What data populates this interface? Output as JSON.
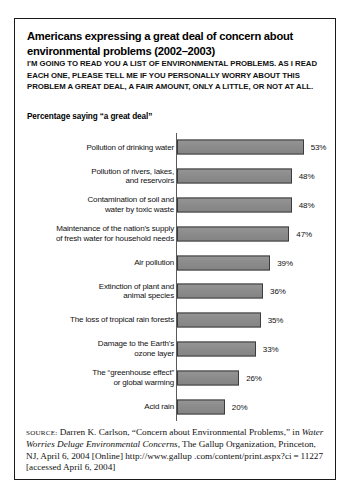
{
  "running_head": "FOR TABLE 5.5",
  "figure": {
    "title": "Americans expressing a great deal of concern about environmental problems (2002–2003)",
    "question": "I'M GOING TO READ YOU A LIST OF ENVIRONMENTAL PROBLEMS. AS I READ EACH ONE, PLEASE TELL ME IF YOU PERSONALLY WORRY ABOUT THIS PROBLEM A GREAT DEAL, A FAIR AMOUNT, ONLY A LITTLE, OR NOT AT ALL.",
    "subheading": "Percentage saying “a great deal”"
  },
  "source": {
    "label": "source:",
    "text_1": " Darren K. Carlson, “Concern about Environmental Problems,” in ",
    "italic_1": "Water Worries Deluge Environmental Concerns,",
    "text_2": " The Gallup Organization, Princeton, NJ, April 6, 2004 [Online] http://www.gallup .com/content/print.aspx?ci = 11227 [accessed April 6, 2004]"
  },
  "colors": {
    "bar_fill": "#8c8c8c",
    "bar_border": "#3c3c3c",
    "frame": "#1a1a1a",
    "axis": "#5a5a5a",
    "text": "#111111"
  },
  "chart_data": {
    "type": "bar",
    "orientation": "horizontal",
    "title": "Americans expressing a great deal of concern about environmental problems (2002–2003)",
    "subtitle": "Percentage saying “a great deal”",
    "xlabel": "",
    "ylabel": "",
    "xlim": [
      0,
      60
    ],
    "grid": false,
    "legend": "none",
    "value_suffix": "%",
    "categories": [
      "Pollution of drinking water",
      "Pollution of rivers, lakes, and reservoirs",
      "Contamination of soil and water by toxic waste",
      "Maintenance of the nation's supply of fresh water for household needs",
      "Air pollution",
      "Extinction of plant and animal species",
      "The loss of tropical rain forests",
      "Damage to the Earth's ozone layer",
      "The “greenhouse effect” or global warming",
      "Acid rain"
    ],
    "values": [
      53,
      48,
      48,
      47,
      39,
      36,
      35,
      33,
      26,
      20
    ],
    "value_labels": [
      "53%",
      "48%",
      "48%",
      "47%",
      "39%",
      "36%",
      "35%",
      "33%",
      "26%",
      "20%"
    ],
    "bars": [
      {
        "label_lines": [
          "Pollution of drinking water"
        ],
        "value": 53,
        "value_label": "53%"
      },
      {
        "label_lines": [
          "Pollution of rivers, lakes,",
          "and reservoirs"
        ],
        "value": 48,
        "value_label": "48%"
      },
      {
        "label_lines": [
          "Contamination of soil and",
          "water by toxic waste"
        ],
        "value": 48,
        "value_label": "48%"
      },
      {
        "label_lines": [
          "Maintenance of the nation's supply",
          "of fresh water for household needs"
        ],
        "value": 47,
        "value_label": "47%"
      },
      {
        "label_lines": [
          "Air pollution"
        ],
        "value": 39,
        "value_label": "39%"
      },
      {
        "label_lines": [
          "Extinction of plant and",
          "animal species"
        ],
        "value": 36,
        "value_label": "36%"
      },
      {
        "label_lines": [
          "The loss of tropical rain forests"
        ],
        "value": 35,
        "value_label": "35%"
      },
      {
        "label_lines": [
          "Damage to the Earth's",
          "ozone layer"
        ],
        "value": 33,
        "value_label": "33%"
      },
      {
        "label_lines": [
          "The “greenhouse effect”",
          "or global warming"
        ],
        "value": 26,
        "value_label": "26%"
      },
      {
        "label_lines": [
          "Acid rain"
        ],
        "value": 20,
        "value_label": "20%"
      }
    ]
  }
}
